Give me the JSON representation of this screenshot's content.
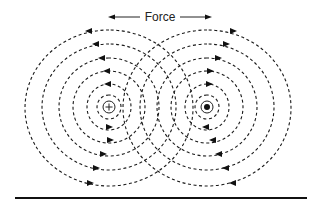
{
  "diagram": {
    "force_label": "Force",
    "left_conductor": {
      "symbol": "plus",
      "meaning": "current into page",
      "cx": 109,
      "cy": 107
    },
    "right_conductor": {
      "symbol": "dot",
      "meaning": "current out of page",
      "cx": 207,
      "cy": 107
    },
    "left_field_rings": [
      {
        "rx": 12,
        "ry": 12,
        "direction": "counterclockwise"
      },
      {
        "rx": 22,
        "ry": 23,
        "direction": "counterclockwise"
      },
      {
        "rx": 36,
        "ry": 36,
        "direction": "counterclockwise"
      },
      {
        "rx": 50,
        "ry": 49,
        "direction": "counterclockwise"
      },
      {
        "rx": 67,
        "ry": 63,
        "direction": "counterclockwise"
      },
      {
        "rx": 84,
        "ry": 78,
        "direction": "counterclockwise"
      }
    ],
    "right_field_rings": [
      {
        "rx": 12,
        "ry": 12,
        "direction": "counterclockwise"
      },
      {
        "rx": 22,
        "ry": 23,
        "direction": "counterclockwise"
      },
      {
        "rx": 36,
        "ry": 36,
        "direction": "counterclockwise"
      },
      {
        "rx": 50,
        "ry": 49,
        "direction": "counterclockwise"
      },
      {
        "rx": 67,
        "ry": 63,
        "direction": "counterclockwise"
      },
      {
        "rx": 84,
        "ry": 78,
        "direction": "counterclockwise"
      }
    ],
    "colors": {
      "ink": "#111111",
      "background": "#ffffff"
    }
  }
}
